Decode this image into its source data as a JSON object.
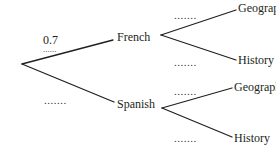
{
  "diagram": {
    "type": "probability-tree",
    "root": {
      "branches": [
        {
          "label": "French",
          "probability": "0.7",
          "branches": [
            {
              "label": "Geography",
              "probability": "......."
            },
            {
              "label": "History",
              "probability": "......."
            }
          ]
        },
        {
          "label": "Spanish",
          "probability": ".......",
          "branches": [
            {
              "label": "Geography",
              "probability": "......."
            },
            {
              "label": "History",
              "probability": "......."
            }
          ]
        }
      ]
    },
    "line_color": "#231f20"
  },
  "labels": {
    "french": "French",
    "spanish": "Spanish",
    "french_geography": "Geography",
    "french_history": "History",
    "spanish_geography": "Geography",
    "spanish_history": "History"
  },
  "probabilities": {
    "french": "0.7",
    "french_underline": "......",
    "spanish": ".......",
    "french_geography": ".......",
    "french_history": ".......",
    "spanish_geography": ".......",
    "spanish_history": "......."
  }
}
